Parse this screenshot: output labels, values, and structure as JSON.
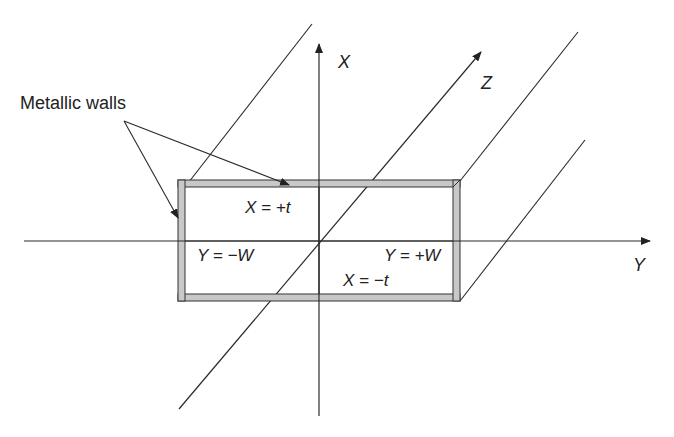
{
  "diagram": {
    "callout_label": "Metallic walls",
    "axes": {
      "x_label": "X",
      "y_label": "Y",
      "z_label": "Z"
    },
    "boundary_labels": {
      "top": "X = +t",
      "bottom": "X = −t",
      "left": "Y = −W",
      "right": "Y = +W"
    },
    "colors": {
      "line": "#2a2a2a",
      "wall_fill": "#c8c8c8",
      "wall_border": "#333333",
      "text": "#222222"
    }
  }
}
